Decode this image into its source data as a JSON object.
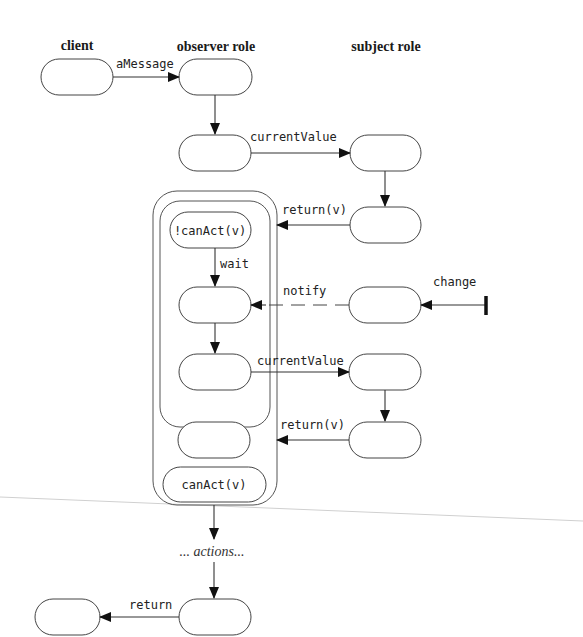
{
  "headings": {
    "client": "client",
    "observer": "observer role",
    "subject": "subject role"
  },
  "messages": {
    "aMessage": "aMessage",
    "currentValue1": "currentValue",
    "return1": "return(v)",
    "wait": "wait",
    "notify": "notify",
    "change": "change",
    "currentValue2": "currentValue",
    "return2": "return(v)",
    "actions": "... actions...",
    "return_final": "return"
  },
  "states": {
    "not_can_act": "!canAct(v)",
    "can_act": "canAct(v)"
  },
  "colors": {
    "stroke": "#444444",
    "background": "#ffffff"
  }
}
